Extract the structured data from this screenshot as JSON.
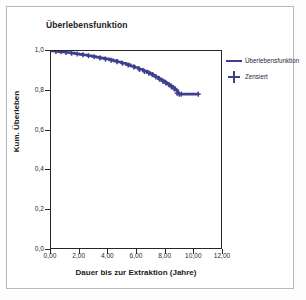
{
  "chart_data": {
    "type": "line",
    "title": "Überlebensfunktion",
    "xlabel": "Dauer bis zur Extraktion (Jahre)",
    "ylabel": "Kum. Überleben",
    "xlim": [
      0,
      12
    ],
    "ylim": [
      0.0,
      1.0
    ],
    "grid": false,
    "legend_position": "right-outside",
    "xticks": [
      0,
      2,
      4,
      6,
      8,
      10,
      12
    ],
    "xtick_labels": [
      "0,00",
      "2,00",
      "4,00",
      "6,00",
      "8,00",
      "10,00",
      "12,00"
    ],
    "yticks": [
      0.0,
      0.2,
      0.4,
      0.6,
      0.8,
      1.0
    ],
    "ytick_labels": [
      "0,0",
      "0,2",
      "0,4",
      "0,6",
      "0,8",
      "1,0"
    ],
    "series": [
      {
        "name": "Überlebensfunktion",
        "kind": "kaplan-meier-step",
        "color": "#3f3f8f",
        "x": [
          0.0,
          0.25,
          0.5,
          0.8,
          1.1,
          1.4,
          1.7,
          2.0,
          2.3,
          2.6,
          2.9,
          3.2,
          3.5,
          3.8,
          4.1,
          4.4,
          4.7,
          5.0,
          5.3,
          5.6,
          5.9,
          6.2,
          6.5,
          6.8,
          7.0,
          7.2,
          7.4,
          7.6,
          7.8,
          8.0,
          8.15,
          8.3,
          8.45,
          8.6,
          8.75,
          8.85,
          8.95,
          9.05,
          9.2,
          9.6,
          10.4
        ],
        "y": [
          1.0,
          0.999,
          0.997,
          0.995,
          0.992,
          0.989,
          0.986,
          0.983,
          0.98,
          0.976,
          0.972,
          0.968,
          0.964,
          0.96,
          0.955,
          0.95,
          0.944,
          0.938,
          0.931,
          0.924,
          0.916,
          0.907,
          0.898,
          0.89,
          0.884,
          0.876,
          0.868,
          0.859,
          0.85,
          0.843,
          0.836,
          0.83,
          0.822,
          0.815,
          0.806,
          0.8,
          0.785,
          0.781,
          0.781,
          0.781,
          0.781
        ]
      }
    ],
    "censored": {
      "name": "Zensiert",
      "marker": "plus",
      "color": "#3f3f8f",
      "x": [
        0.35,
        0.7,
        1.05,
        1.45,
        1.85,
        2.25,
        2.65,
        3.05,
        3.45,
        3.85,
        4.25,
        4.65,
        5.05,
        5.45,
        5.85,
        6.25,
        6.6,
        6.9,
        7.15,
        7.4,
        7.65,
        7.9,
        8.1,
        8.3,
        8.5,
        8.7,
        8.9,
        9.05,
        9.2,
        10.4
      ],
      "y": [
        0.998,
        0.996,
        0.993,
        0.989,
        0.985,
        0.981,
        0.976,
        0.971,
        0.965,
        0.959,
        0.953,
        0.946,
        0.938,
        0.929,
        0.919,
        0.906,
        0.896,
        0.888,
        0.88,
        0.868,
        0.857,
        0.846,
        0.838,
        0.83,
        0.818,
        0.808,
        0.786,
        0.781,
        0.781,
        0.781
      ]
    },
    "legend": [
      {
        "label": "Überlebensfunktion",
        "marker": "line"
      },
      {
        "label": "Zensiert",
        "marker": "plus"
      }
    ]
  }
}
